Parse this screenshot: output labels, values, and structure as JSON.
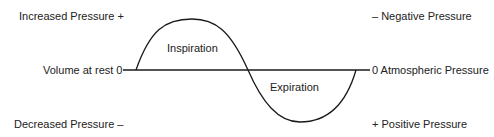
{
  "diagram": {
    "left_labels": {
      "top": "Increased Pressure +",
      "middle": "Volume at rest 0",
      "bottom": "Decreased Pressure –"
    },
    "right_labels": {
      "top": "– Negative Pressure",
      "middle": "0 Atmospheric Pressure",
      "bottom": "+ Positive Pressure"
    },
    "phases": {
      "upper": "Inspiration",
      "lower": "Expiration"
    },
    "colors": {
      "line": "#1a1a1a",
      "text": "#222222",
      "background": "#ffffff"
    }
  }
}
